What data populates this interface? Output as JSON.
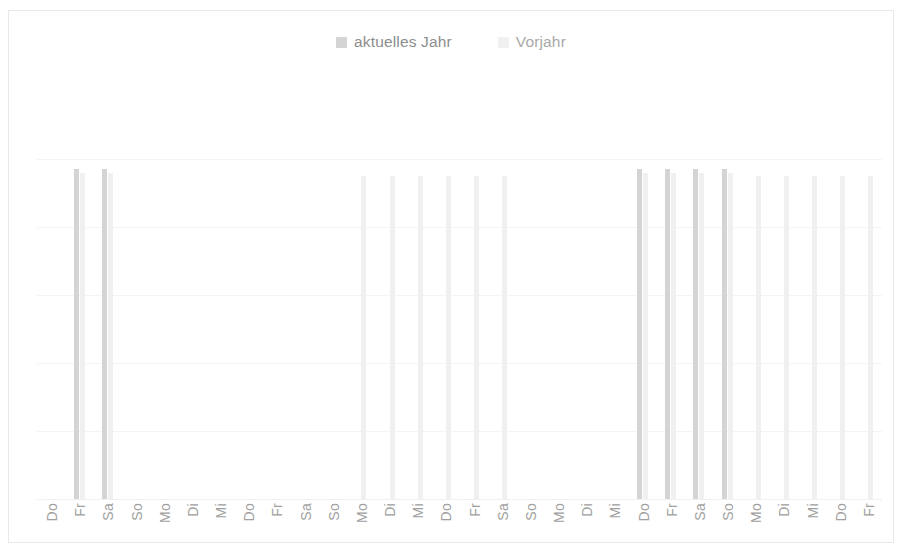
{
  "chart_data": {
    "type": "bar",
    "title": "",
    "subtitle": "",
    "xlabel": "",
    "ylabel": "",
    "grid": true,
    "legend_position": "top-center",
    "axis_tick_labels_rotated": true,
    "ylim": [
      0,
      100
    ],
    "gridline_values": [
      100,
      80,
      60,
      40,
      20
    ],
    "categories": [
      "Do",
      "Fr",
      "Sa",
      "So",
      "Mo",
      "Di",
      "Mi",
      "Do",
      "Fr",
      "Sa",
      "So",
      "Mo",
      "Di",
      "Mi",
      "Do",
      "Fr",
      "Sa",
      "So",
      "Mo",
      "Di",
      "Mi",
      "Do",
      "Fr",
      "Sa",
      "So",
      "Mo",
      "Di",
      "Mi",
      "Do",
      "Fr"
    ],
    "series": [
      {
        "name": "aktuelles Jahr",
        "color": "#d4d4d4",
        "values": [
          0,
          97,
          97,
          0,
          0,
          0,
          0,
          0,
          0,
          0,
          0,
          0,
          0,
          0,
          0,
          0,
          0,
          0,
          0,
          0,
          0,
          97,
          97,
          97,
          97,
          0,
          0,
          0,
          0,
          0
        ]
      },
      {
        "name": "Vorjahr",
        "color": "#f0f0f0",
        "values": [
          0,
          96,
          96,
          0,
          0,
          0,
          0,
          0,
          0,
          0,
          0,
          95,
          95,
          95,
          95,
          95,
          95,
          0,
          0,
          0,
          0,
          96,
          96,
          96,
          96,
          95,
          95,
          95,
          95,
          95
        ]
      }
    ],
    "legend": [
      {
        "label": "aktuelles Jahr",
        "color": "#d4d4d4"
      },
      {
        "label": "Vorjahr",
        "color": "#f0f0f0"
      }
    ]
  }
}
